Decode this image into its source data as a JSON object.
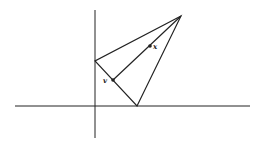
{
  "diagram": {
    "type": "geometric-triangle-on-axes",
    "colors": {
      "stroke": "#222222",
      "background": "#ffffff"
    },
    "axes": {
      "x_axis": {
        "x1": 15,
        "y1": 106,
        "x2": 250,
        "y2": 106
      },
      "y_axis": {
        "x1": 95,
        "y1": 10,
        "x2": 95,
        "y2": 138
      }
    },
    "triangle": {
      "apex": {
        "x": 181,
        "y": 16
      },
      "left_vertex": {
        "x": 95,
        "y": 61
      },
      "bottom_vertex": {
        "x": 137,
        "y": 106
      }
    },
    "segment": {
      "from": "apex",
      "to": "point_v"
    },
    "points": [
      {
        "id": "x",
        "label": "x",
        "x": 150,
        "y": 46,
        "label_x": 153,
        "label_y": 49
      },
      {
        "id": "v",
        "label": "v",
        "x": 113,
        "y": 80,
        "label_x": 103,
        "label_y": 83
      }
    ]
  }
}
